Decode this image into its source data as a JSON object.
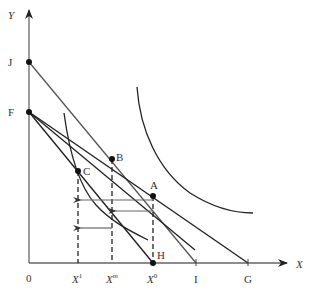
{
  "diagram": {
    "axes": {
      "x_label": "X",
      "y_label": "Y",
      "origin_label": "0"
    },
    "y_axis_points": [
      {
        "label": "J"
      },
      {
        "label": "F"
      }
    ],
    "x_axis_ticks": [
      {
        "label": "X",
        "sup": "1"
      },
      {
        "label": "X",
        "sup": "m"
      },
      {
        "label": "X",
        "sup": "0"
      },
      {
        "label": "I"
      },
      {
        "label": "G"
      }
    ],
    "points": [
      {
        "label": "A"
      },
      {
        "label": "B"
      },
      {
        "label": "C"
      },
      {
        "label": "H"
      }
    ],
    "lines": [
      {
        "name": "budget-line-JI",
        "from": "J",
        "to": "I"
      },
      {
        "name": "budget-line-FG",
        "from": "F",
        "to": "G"
      },
      {
        "name": "budget-line-FH",
        "from": "F",
        "to": "H"
      },
      {
        "name": "compensated-line-through-B-C",
        "from": "F",
        "to": "beyond"
      }
    ],
    "curves": [
      {
        "name": "indifference-curve-upper",
        "through": [
          "B",
          "A"
        ]
      },
      {
        "name": "indifference-curve-lower",
        "through": [
          "C"
        ]
      }
    ],
    "arrows": [
      {
        "name": "total-effect-arrow",
        "from": "X0",
        "to": "X1"
      },
      {
        "name": "substitution-effect-arrow",
        "from": "X0",
        "to": "Xm"
      },
      {
        "name": "income-effect-arrow",
        "from": "Xm",
        "to": "X1"
      }
    ]
  }
}
